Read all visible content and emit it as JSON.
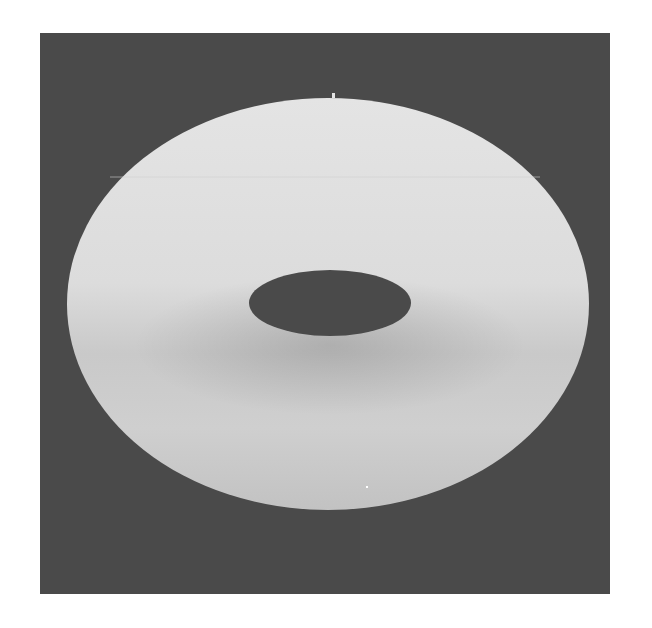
{
  "figure": {
    "colors": {
      "page": "#ffffff",
      "background": "#4a4a4a",
      "torus_highlight": "#e2e2e2",
      "torus_mid": "#d6d6d6",
      "torus_shadow": "#b8b8b8",
      "hole": "#4a4a4a"
    },
    "panel": {
      "x": 40,
      "y": 33,
      "width": 570,
      "height": 561
    },
    "torus": {
      "cx": 328,
      "cy": 304,
      "rx": 261,
      "ry": 206
    },
    "hole": {
      "cx": 330,
      "cy": 303,
      "rx": 81,
      "ry": 33
    }
  }
}
